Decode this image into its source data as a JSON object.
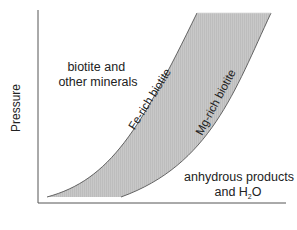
{
  "diagram": {
    "type": "phase-stability",
    "y_axis_label": "Pressure",
    "x_axis_label": "",
    "regions": {
      "upper_left": {
        "line1": "biotite and",
        "line2": "other minerals"
      },
      "lower_right": {
        "line1": "anhydrous products",
        "line2_prefix": "and H",
        "line2_sub": "2",
        "line2_suffix": "O"
      }
    },
    "curves": {
      "fe_curve_label": "Fe-rich biotite",
      "mg_curve_label": "Mg-rich biotite"
    },
    "colors": {
      "band_fill": "#c4c4c4",
      "curve_stroke": "#555555",
      "axis_stroke": "#555555",
      "text": "#222222"
    }
  }
}
